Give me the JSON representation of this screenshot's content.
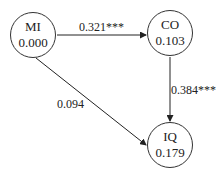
{
  "nodes": {
    "mi": {
      "name": "MI",
      "value": "0.000"
    },
    "co": {
      "name": "CO",
      "value": "0.103"
    },
    "iq": {
      "name": "IQ",
      "value": "0.179"
    }
  },
  "edges": {
    "mi_co": {
      "from": "MI",
      "to": "CO",
      "label": "0.321***"
    },
    "co_iq": {
      "from": "CO",
      "to": "IQ",
      "label": "0.384***"
    },
    "mi_iq": {
      "from": "MI",
      "to": "IQ",
      "label": "0.094"
    }
  }
}
